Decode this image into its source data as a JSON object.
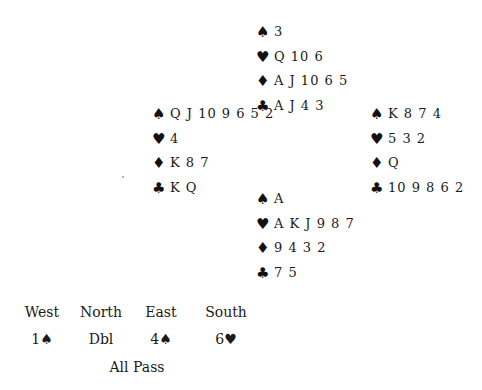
{
  "suits": {
    "spades": "♠",
    "hearts": "♥",
    "diamonds": "♦",
    "clubs": "♣"
  },
  "hands": {
    "north": {
      "spades": "3",
      "hearts": "Q 10 6",
      "diamonds": "A J 10 6 5",
      "clubs": "A J 4 3"
    },
    "west": {
      "spades": "Q J 10 9 6 5 2",
      "hearts": "4",
      "diamonds": "K 8 7",
      "clubs": "K Q"
    },
    "east": {
      "spades": "K 8 7 4",
      "hearts": "5 3 2",
      "diamonds": "Q",
      "clubs": "10 9 8 6 2"
    },
    "south": {
      "spades": "A",
      "hearts": "A K J 9 8 7",
      "diamonds": "9 4 3 2",
      "clubs": "7 5"
    }
  },
  "auction": {
    "headers": [
      "West",
      "North",
      "East",
      "South"
    ],
    "bids": [
      "1♠",
      "Dbl",
      "4♠",
      "6♥"
    ],
    "final": "All Pass"
  }
}
